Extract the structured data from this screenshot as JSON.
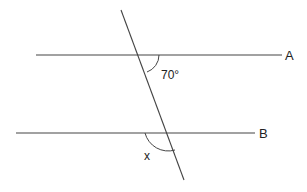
{
  "diagram": {
    "type": "parallel-lines-transversal",
    "background": "#ffffff",
    "line_color": "#444444",
    "lines": {
      "A": {
        "label": "A",
        "x1": 36,
        "y1": 55,
        "x2": 282,
        "y2": 55
      },
      "B": {
        "label": "B",
        "x1": 16,
        "y1": 133,
        "x2": 255,
        "y2": 133
      },
      "transversal": {
        "x1": 121,
        "y1": 10,
        "x2": 184,
        "y2": 180
      }
    },
    "angles": {
      "given": {
        "label": "70°",
        "value_degrees": 70,
        "position": "below-right of intersection with A"
      },
      "unknown": {
        "label": "x",
        "position": "below-left of intersection with B"
      }
    }
  }
}
